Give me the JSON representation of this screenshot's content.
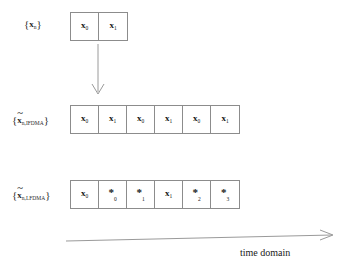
{
  "figure": {
    "background_color": "#ffffff",
    "box_border_color": "#8c8c8c",
    "arrow_color": "#9a9a9a"
  },
  "rows": [
    {
      "id": "input-block",
      "label": {
        "open_brace": "{",
        "symbol": "x",
        "tilde": "",
        "subscript": "n",
        "close_brace": "}",
        "plain": "{x_n}"
      },
      "cells": [
        {
          "kind": "symbol",
          "base": "x",
          "sub": "0",
          "text": "x0"
        },
        {
          "kind": "symbol",
          "base": "x",
          "sub": "1",
          "text": "x1"
        }
      ]
    },
    {
      "id": "ifdma-block",
      "label": {
        "open_brace": "{",
        "symbol": "x",
        "tilde": "~",
        "subscript": "n,IFDMA",
        "close_brace": "}",
        "plain": "{x̃_n,IFDMA}"
      },
      "cells": [
        {
          "kind": "symbol",
          "base": "x",
          "sub": "0",
          "text": "x0"
        },
        {
          "kind": "symbol",
          "base": "x",
          "sub": "1",
          "text": "x1"
        },
        {
          "kind": "symbol",
          "base": "x",
          "sub": "0",
          "text": "x0"
        },
        {
          "kind": "symbol",
          "base": "x",
          "sub": "1",
          "text": "x1"
        },
        {
          "kind": "symbol",
          "base": "x",
          "sub": "0",
          "text": "x0"
        },
        {
          "kind": "symbol",
          "base": "x",
          "sub": "1",
          "text": "x1"
        }
      ]
    },
    {
      "id": "lfdma-block",
      "label": {
        "open_brace": "{",
        "symbol": "x",
        "tilde": "~",
        "subscript": "n,LFDMA",
        "close_brace": "}",
        "plain": "{x̃_n,LFDMA}"
      },
      "cells": [
        {
          "kind": "symbol",
          "base": "x",
          "sub": "0",
          "text": "x0"
        },
        {
          "kind": "star",
          "base": "*",
          "sub": "0",
          "text": "*0"
        },
        {
          "kind": "star",
          "base": "*",
          "sub": "1",
          "text": "*1"
        },
        {
          "kind": "symbol",
          "base": "x",
          "sub": "1",
          "text": "x1"
        },
        {
          "kind": "star",
          "base": "*",
          "sub": "2",
          "text": "*2"
        },
        {
          "kind": "star",
          "base": "*",
          "sub": "3",
          "text": "*3"
        }
      ]
    }
  ],
  "arrows": {
    "mapping_arrow": {
      "direction": "down",
      "label": ""
    },
    "time_axis_arrow": {
      "direction": "right",
      "label": "time domain"
    }
  }
}
